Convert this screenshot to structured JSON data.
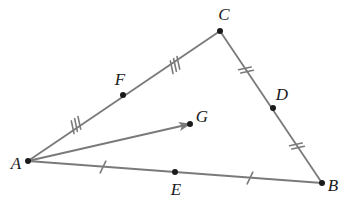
{
  "figure": {
    "width": 344,
    "height": 210,
    "background_color": "#ffffff",
    "line_color": "#7a7a7a",
    "point_color": "#1a1a1a",
    "label_color": "#1a1a1a",
    "line_width": 1.8
  },
  "points": [
    {
      "id": "A",
      "label": "A",
      "x": 28,
      "y": 161,
      "label_x": 16,
      "label_y": 163,
      "dot": true
    },
    {
      "id": "B",
      "label": "B",
      "x": 322,
      "y": 183,
      "label_x": 333,
      "label_y": 185,
      "dot": true
    },
    {
      "id": "C",
      "label": "C",
      "x": 220,
      "y": 31,
      "label_x": 224,
      "label_y": 14,
      "dot": true
    },
    {
      "id": "D",
      "label": "D",
      "x": 273,
      "y": 108,
      "label_x": 282,
      "label_y": 94,
      "dot": true
    },
    {
      "id": "E",
      "label": "E",
      "x": 175,
      "y": 172,
      "label_x": 176,
      "label_y": 189,
      "dot": true
    },
    {
      "id": "F",
      "label": "F",
      "x": 123,
      "y": 95,
      "label_x": 120,
      "label_y": 79,
      "dot": true
    },
    {
      "id": "G",
      "label": "G",
      "x": 190,
      "y": 124,
      "label_x": 202,
      "label_y": 116,
      "dot": true
    }
  ],
  "segments": [
    {
      "id": "AC",
      "from": "A",
      "to": "C",
      "x1": 28,
      "y1": 161,
      "x2": 220,
      "y2": 31,
      "arrow": false
    },
    {
      "id": "CB",
      "from": "C",
      "to": "B",
      "x1": 220,
      "y1": 31,
      "x2": 322,
      "y2": 183,
      "arrow": false
    },
    {
      "id": "AB",
      "from": "A",
      "to": "B",
      "x1": 28,
      "y1": 161,
      "x2": 322,
      "y2": 183,
      "arrow": false
    },
    {
      "id": "AG",
      "from": "A",
      "to": "G",
      "x1": 28,
      "y1": 161,
      "x2": 190,
      "y2": 124,
      "arrow": true
    }
  ],
  "tick_marks": [
    {
      "id": "tick-AF",
      "on_segment": "AF",
      "count": 3,
      "x": 76,
      "y": 125,
      "angle": -34
    },
    {
      "id": "tick-FC",
      "on_segment": "FC",
      "count": 3,
      "x": 175,
      "y": 65,
      "angle": -34
    },
    {
      "id": "tick-CD",
      "on_segment": "CD",
      "count": 2,
      "x": 246,
      "y": 70,
      "angle": 56
    },
    {
      "id": "tick-DB",
      "on_segment": "DB",
      "count": 2,
      "x": 297,
      "y": 146,
      "angle": 56
    },
    {
      "id": "tick-AE",
      "on_segment": "AE",
      "count": 1,
      "x": 103,
      "y": 167,
      "angle": 4
    },
    {
      "id": "tick-EB",
      "on_segment": "EB",
      "count": 1,
      "x": 250,
      "y": 178,
      "angle": 4
    }
  ]
}
